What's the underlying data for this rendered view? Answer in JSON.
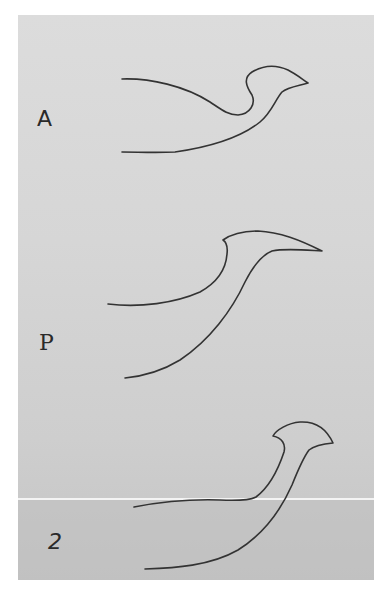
{
  "figure": {
    "panels": [
      {
        "label": "A",
        "description": "profile curve A"
      },
      {
        "label": "P",
        "description": "profile curve P"
      },
      {
        "label": "2",
        "description": "profile curve 2"
      }
    ]
  },
  "colors": {
    "background": "#d6d6d6",
    "stroke": "#333333",
    "scan_line": "#f4f4f4"
  }
}
